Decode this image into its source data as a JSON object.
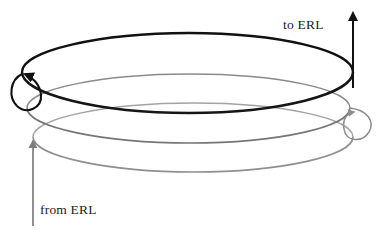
{
  "figure": {
    "title": "",
    "type": "spiral-beam-recirculation-diagram",
    "background_color": "#ffffff"
  },
  "labels": {
    "to_erl": "to ERL",
    "from_erl": "from ERL"
  },
  "colors": {
    "beam_high_energy": "#111111",
    "beam_mid_energy": "#6e6e6e",
    "beam_low_energy": "#9a9a9a",
    "arrow_in": "#7d7d7d",
    "arrow_out": "#111111",
    "background": "#ffffff"
  },
  "diagram_elements": [
    {
      "name": "outgoing-arrow",
      "icon": "arrow-up-icon",
      "label": "to ERL",
      "color": "#111111",
      "direction": "up"
    },
    {
      "name": "incoming-arrow",
      "icon": "arrow-up-icon",
      "label": "from ERL",
      "color": "#7d7d7d",
      "direction": "up"
    },
    {
      "name": "spiral-turn-lower",
      "color": "#9a9a9a"
    },
    {
      "name": "spiral-turn-middle",
      "color": "#6e6e6e"
    },
    {
      "name": "spiral-turn-upper",
      "color": "#111111"
    },
    {
      "name": "left-return-loop",
      "icon": "loop-arrow-icon",
      "color": "#111111"
    },
    {
      "name": "right-return-loop",
      "icon": "loop-arrow-icon",
      "color": "#8d8d8d"
    }
  ]
}
